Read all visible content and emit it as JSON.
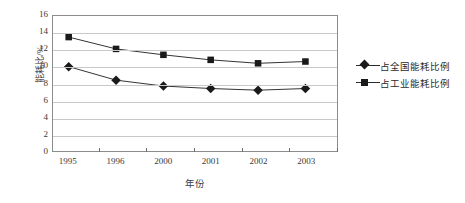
{
  "chart_data": {
    "type": "line",
    "title": "",
    "xlabel": "年份",
    "ylabel": "能耗比/%",
    "categories": [
      "1995",
      "1996",
      "2000",
      "2001",
      "2002",
      "2003"
    ],
    "ylim": [
      0,
      16
    ],
    "yticks": [
      "16",
      "14",
      "12",
      "10",
      "8",
      "6",
      "4",
      "2",
      "0"
    ],
    "ytick_values": [
      16,
      14,
      12,
      10,
      8,
      6,
      4,
      2,
      0
    ],
    "grid": "horizontal",
    "legend_position": "right",
    "series": [
      {
        "name": "占全国能耗比例",
        "marker": "diamond",
        "color": "#1a1a1a",
        "values": [
          10.0,
          8.4,
          7.7,
          7.4,
          7.2,
          7.4
        ]
      },
      {
        "name": "占工业能耗比例",
        "marker": "square",
        "color": "#1a1a1a",
        "values": [
          13.5,
          12.1,
          11.4,
          10.8,
          10.4,
          10.6
        ]
      }
    ]
  }
}
